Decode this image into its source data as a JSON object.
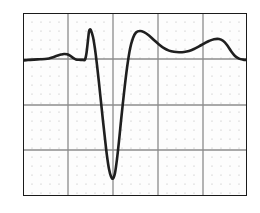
{
  "figure": {
    "kind": "ecg-waveform-strip",
    "caption": "",
    "background_color": "#ffffff",
    "paper_color": "#fdfdfd"
  },
  "grid": {
    "border_color": "#1a1a1a",
    "border_width_px": 2,
    "major_color": "#8c8c8c",
    "major_width_px": 1.3,
    "minor_dot_color": "#b9b9b9",
    "minor_dot_radius_px": 0.62,
    "columns": 5,
    "rows": 4,
    "major_x_px": [
      0,
      45,
      90,
      135,
      180,
      224
    ],
    "major_y_px": [
      0,
      46,
      92,
      137,
      183
    ],
    "minor_per_major": 5,
    "minor_step_px": 9
  },
  "chart_data": {
    "type": "line",
    "title": "",
    "xlabel": "",
    "ylabel": "",
    "xlim": [
      0,
      224
    ],
    "ylim": [
      183,
      0
    ],
    "grid": true,
    "legend": false,
    "series": [
      {
        "name": "ecg-trace",
        "color": "#1f1f1f",
        "line_width_px": 2.6,
        "x": [
          0,
          5,
          11,
          17,
          22,
          26,
          30,
          34,
          38,
          41,
          44,
          47,
          50,
          53,
          56,
          58,
          60,
          62,
          63.5,
          65,
          66,
          67,
          68,
          70,
          72,
          74,
          76,
          78,
          80,
          82,
          84,
          86,
          88,
          90,
          92,
          94,
          96,
          98,
          101,
          104,
          107,
          110,
          113,
          117,
          121,
          126,
          131,
          136,
          141,
          146,
          151,
          156,
          161,
          166,
          171,
          176,
          181,
          186,
          191,
          196,
          200,
          204,
          208,
          212,
          216,
          220,
          224
        ],
        "y": [
          47.5,
          47.0,
          46.6,
          46.3,
          46.0,
          45.4,
          44.2,
          42.8,
          41.6,
          41.0,
          41.3,
          42.6,
          44.8,
          46.4,
          46.8,
          46.9,
          46.9,
          46.6,
          40.0,
          27.0,
          18.5,
          16.5,
          17.5,
          24.0,
          36.0,
          52.0,
          70.0,
          89.0,
          108.0,
          126.0,
          143.0,
          156.0,
          163.5,
          165.5,
          160.0,
          146.0,
          128.0,
          108.0,
          80.0,
          55.0,
          36.0,
          25.0,
          19.5,
          18.0,
          19.2,
          22.5,
          27.0,
          31.5,
          35.2,
          37.6,
          38.8,
          39.2,
          39.0,
          38.0,
          36.0,
          33.4,
          30.6,
          28.0,
          26.2,
          26.0,
          27.8,
          32.0,
          38.0,
          43.0,
          45.6,
          46.6,
          46.9
        ]
      }
    ],
    "annotations": [
      {
        "name": "p-wave",
        "x": 41,
        "y": 41,
        "label": ""
      },
      {
        "name": "r-peak",
        "x": 66,
        "y": 16.5,
        "label": ""
      },
      {
        "name": "s-trough",
        "x": 90,
        "y": 165.5,
        "label": ""
      },
      {
        "name": "rebound-peak",
        "x": 117,
        "y": 18,
        "label": ""
      },
      {
        "name": "st-dip",
        "x": 156,
        "y": 39.2,
        "label": ""
      },
      {
        "name": "t-wave-peak",
        "x": 196,
        "y": 26,
        "label": ""
      },
      {
        "name": "baseline",
        "x": 0,
        "y": 46.5,
        "label": ""
      }
    ]
  }
}
